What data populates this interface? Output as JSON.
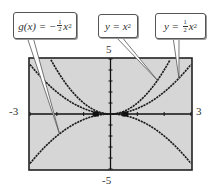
{
  "figure": {
    "window": {
      "xmin": "-3",
      "xmax": "3",
      "ymin": "-5",
      "ymax": "5"
    },
    "callouts": [
      {
        "id": "g",
        "prefix": "g(x) = −",
        "frac_num": "1",
        "frac_den": "2",
        "var": "x",
        "exp": "2"
      },
      {
        "id": "y1",
        "prefix": "y = ",
        "var": "x",
        "exp": "2"
      },
      {
        "id": "y2",
        "prefix": "y = ",
        "frac_num": "1",
        "frac_den": "2",
        "var": "x",
        "exp": "2"
      }
    ],
    "colors": {
      "plot_bg": "#d6d6d6",
      "curve": "#1a1a1a",
      "frame": "#222222",
      "callout_border": "#555555"
    }
  },
  "chart_data": {
    "type": "line",
    "title": "",
    "xlabel": "",
    "ylabel": "",
    "xlim": [
      -3,
      3
    ],
    "ylim": [
      -5,
      5
    ],
    "x_ticks": [
      -3,
      -2,
      -1,
      0,
      1,
      2,
      3
    ],
    "y_ticks": [
      -5,
      -4,
      -3,
      -2,
      -1,
      0,
      1,
      2,
      3,
      4,
      5
    ],
    "grid": false,
    "series": [
      {
        "name": "y = x^2",
        "function": "x^2",
        "x": [
          -2.24,
          -2,
          -1.5,
          -1,
          -0.5,
          0,
          0.5,
          1,
          1.5,
          2,
          2.24
        ],
        "values": [
          5,
          4,
          2.25,
          1,
          0.25,
          0,
          0.25,
          1,
          2.25,
          4,
          5
        ]
      },
      {
        "name": "y = 1/2 x^2",
        "function": "0.5*x^2",
        "x": [
          -3,
          -2,
          -1,
          0,
          1,
          2,
          3
        ],
        "values": [
          4.5,
          2,
          0.5,
          0,
          0.5,
          2,
          4.5
        ]
      },
      {
        "name": "g(x) = -1/2 x^2",
        "function": "-0.5*x^2",
        "x": [
          -3,
          -2,
          -1,
          0,
          1,
          2,
          3
        ],
        "values": [
          -4.5,
          -2,
          -0.5,
          0,
          -0.5,
          -2,
          -4.5
        ]
      }
    ],
    "annotations": [
      "g(x) = -1/2 x^2",
      "y = x^2",
      "y = 1/2 x^2"
    ]
  }
}
